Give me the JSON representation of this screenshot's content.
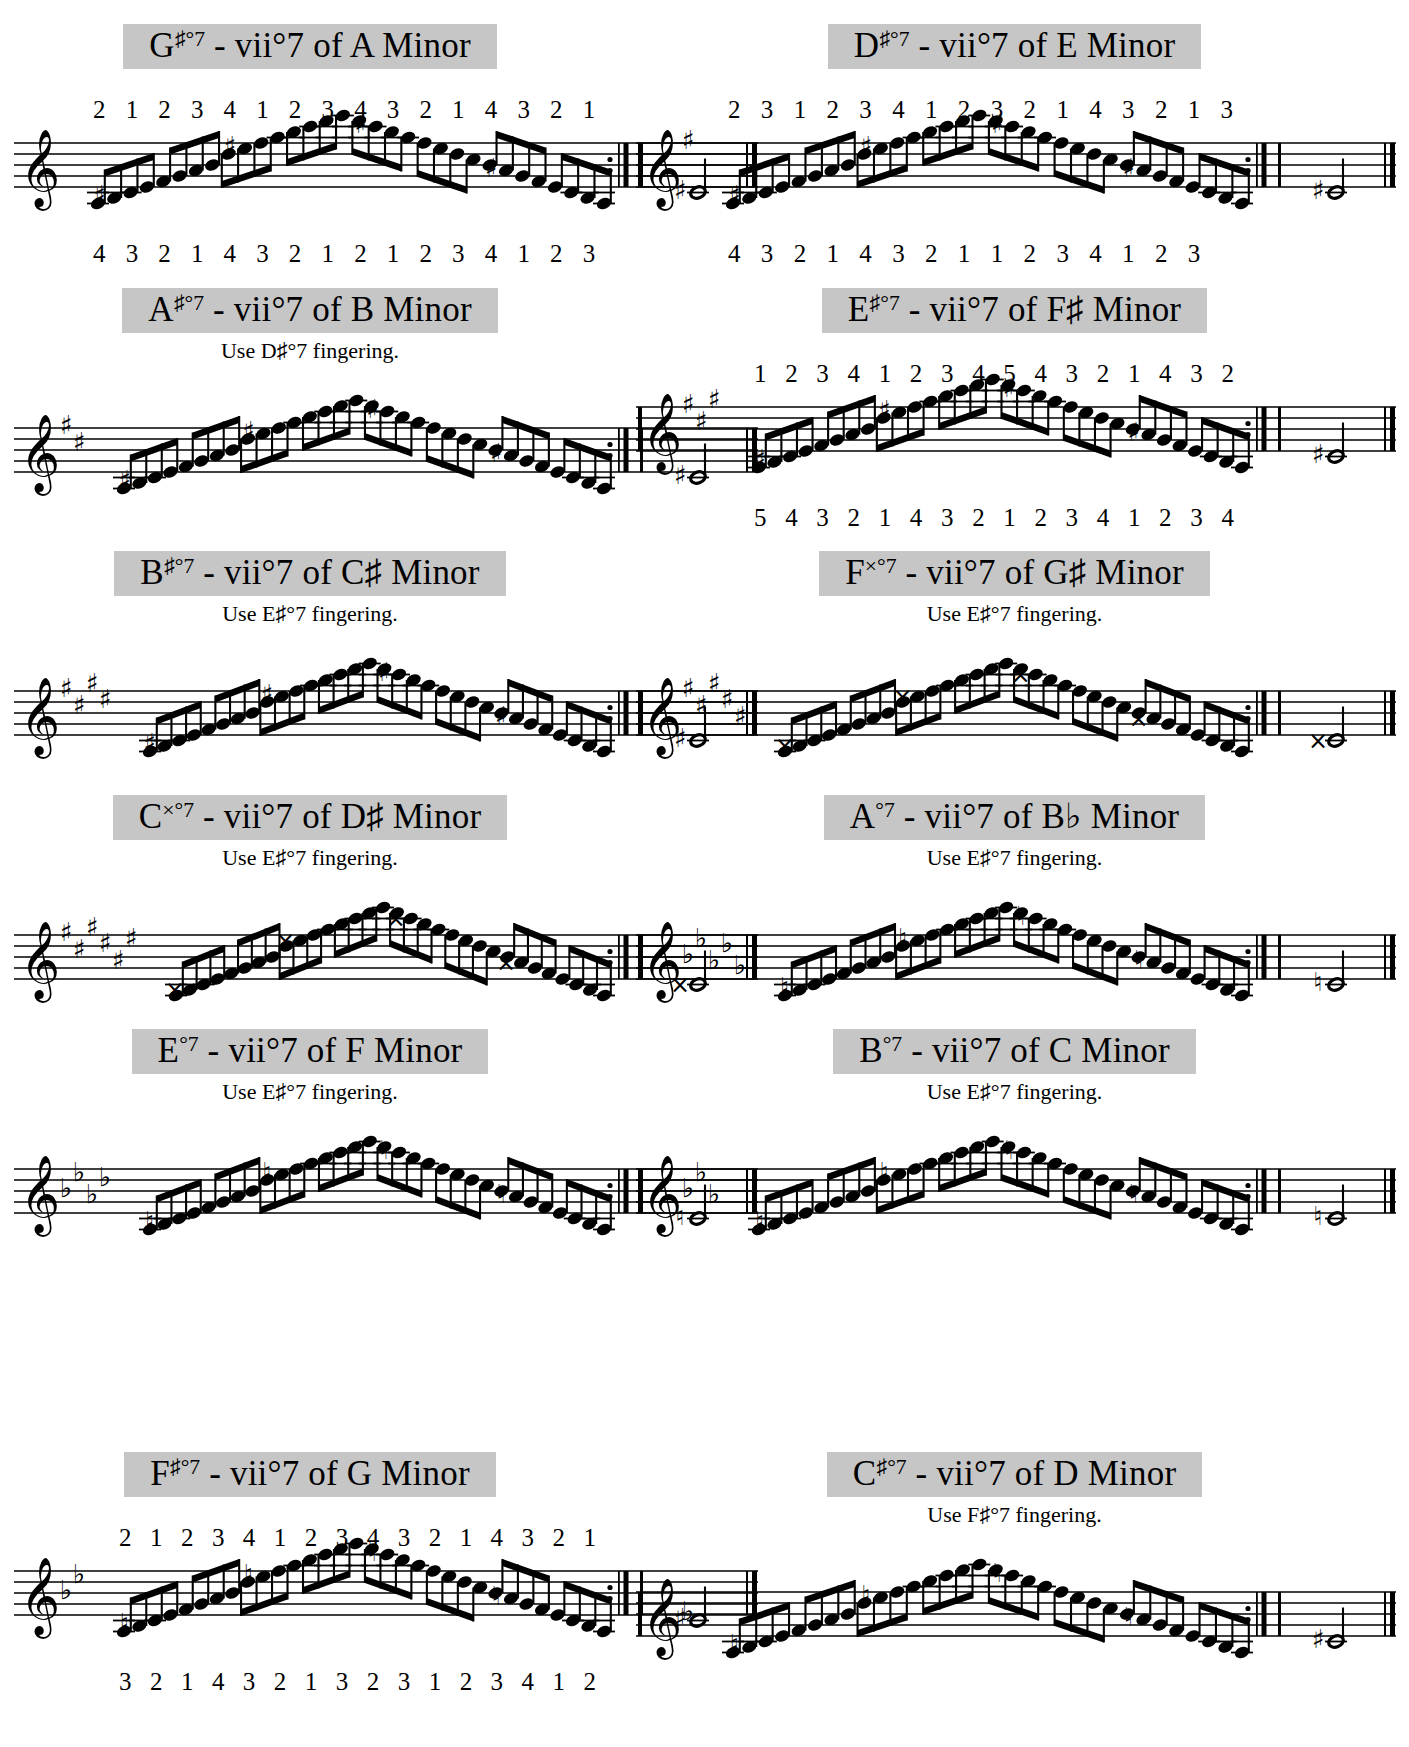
{
  "page": {
    "kind": "sheet-music",
    "instrument_clef": "treble",
    "note_value": "eighth",
    "final_note_value": "half",
    "columns": 2,
    "rows": 6,
    "banner_color": "#c6c6c6",
    "ink_color": "#000000",
    "paper_color": "#ffffff"
  },
  "glyphs": {
    "sharp": "♯",
    "flat": "♭",
    "natural": "♮",
    "double_sharp": "×",
    "degree": "°",
    "treble_clef": "𝄞"
  },
  "exercises": [
    {
      "id": "gs-dim7",
      "root": "G",
      "root_accidental": "sharp",
      "title_root": "G",
      "title_sup": "♯°7",
      "title_rest": " - vii°7 of A Minor",
      "key_of": "A Minor",
      "subtitle": "",
      "key_signature": [],
      "fingering_above": [
        "2",
        "1",
        "2",
        "3",
        "4",
        "1",
        "2",
        "3",
        "4",
        "3",
        "2",
        "1",
        "4",
        "3",
        "2",
        "1"
      ],
      "fingering_below": [
        "4",
        "3",
        "2",
        "1",
        "4",
        "3",
        "2",
        "1",
        "2",
        "1",
        "2",
        "3",
        "4",
        "1",
        "2",
        "3"
      ],
      "repeat_start": false,
      "repeat_end": true,
      "final_note_accidental": "sharp"
    },
    {
      "id": "ds-dim7",
      "root": "D",
      "root_accidental": "sharp",
      "title_root": "D",
      "title_sup": "♯°7",
      "title_rest": " - vii°7 of E Minor",
      "key_of": "E Minor",
      "subtitle": "",
      "key_signature": [
        "sharp"
      ],
      "fingering_above": [
        "2",
        "3",
        "1",
        "2",
        "3",
        "4",
        "1",
        "2",
        "3",
        "2",
        "1",
        "4",
        "3",
        "2",
        "1",
        "3"
      ],
      "fingering_below": [
        "4",
        "3",
        "2",
        "1",
        "4",
        "3",
        "2",
        "1",
        "1",
        "2",
        "3",
        "4",
        "1",
        "2",
        "3",
        ""
      ],
      "repeat_start": true,
      "repeat_end": true,
      "final_note_accidental": "sharp"
    },
    {
      "id": "as-dim7",
      "root": "A",
      "root_accidental": "sharp",
      "title_root": "A",
      "title_sup": "♯°7",
      "title_rest": " - vii°7 of B Minor",
      "key_of": "B Minor",
      "subtitle": "Use D♯°7 fingering.",
      "subtitle_plain": "Use D#°7 fingering.",
      "key_signature": [
        "sharp",
        "sharp"
      ],
      "fingering_above": [],
      "fingering_below": [],
      "repeat_start": false,
      "repeat_end": true,
      "final_note_accidental": "sharp"
    },
    {
      "id": "es-dim7",
      "root": "E",
      "root_accidental": "sharp",
      "title_root": "E",
      "title_sup": "♯°7",
      "title_rest": " - vii°7 of F♯ Minor",
      "key_of": "F# Minor",
      "subtitle": "",
      "key_signature": [
        "sharp",
        "sharp",
        "sharp"
      ],
      "fingering_above": [
        "1",
        "2",
        "3",
        "4",
        "1",
        "2",
        "3",
        "4",
        "5",
        "4",
        "3",
        "2",
        "1",
        "4",
        "3",
        "2"
      ],
      "fingering_below": [
        "5",
        "4",
        "3",
        "2",
        "1",
        "4",
        "3",
        "2",
        "1",
        "2",
        "3",
        "4",
        "1",
        "2",
        "3",
        "4"
      ],
      "repeat_start": true,
      "repeat_end": true,
      "final_note_accidental": "sharp"
    },
    {
      "id": "bs-dim7",
      "root": "B",
      "root_accidental": "sharp",
      "title_root": "B",
      "title_sup": "♯°7",
      "title_rest": " - vii°7 of C♯ Minor",
      "key_of": "C# Minor",
      "subtitle": "Use E♯°7 fingering.",
      "subtitle_plain": "Use E#°7 fingering.",
      "key_signature": [
        "sharp",
        "sharp",
        "sharp",
        "sharp"
      ],
      "fingering_above": [],
      "fingering_below": [],
      "repeat_start": false,
      "repeat_end": true,
      "final_note_accidental": "sharp"
    },
    {
      "id": "fx-dim7",
      "root": "F",
      "root_accidental": "double_sharp",
      "title_root": "F",
      "title_sup": "×°7",
      "title_rest": " - vii°7 of G♯ Minor",
      "key_of": "G# Minor",
      "subtitle": "Use E♯°7 fingering.",
      "subtitle_plain": "Use E#°7 fingering.",
      "key_signature": [
        "sharp",
        "sharp",
        "sharp",
        "sharp",
        "sharp"
      ],
      "fingering_above": [],
      "fingering_below": [],
      "repeat_start": true,
      "repeat_end": true,
      "final_note_accidental": "double_sharp"
    },
    {
      "id": "cx-dim7",
      "root": "C",
      "root_accidental": "double_sharp",
      "title_root": "C",
      "title_sup": "×°7",
      "title_rest": " - vii°7 of D♯ Minor",
      "key_of": "D# Minor",
      "subtitle": "Use E♯°7 fingering.",
      "subtitle_plain": "Use E#°7 fingering.",
      "key_signature": [
        "sharp",
        "sharp",
        "sharp",
        "sharp",
        "sharp",
        "sharp"
      ],
      "fingering_above": [],
      "fingering_below": [],
      "repeat_start": false,
      "repeat_end": true,
      "final_note_accidental": "double_sharp"
    },
    {
      "id": "a-dim7",
      "root": "A",
      "root_accidental": "natural",
      "title_root": "A",
      "title_sup": "°7",
      "title_rest": " - vii°7 of B♭ Minor",
      "key_of": "Bb Minor",
      "subtitle": "Use E♯°7 fingering.",
      "subtitle_plain": "Use E#°7 fingering.",
      "key_signature": [
        "flat",
        "flat",
        "flat",
        "flat",
        "flat"
      ],
      "fingering_above": [],
      "fingering_below": [],
      "repeat_start": true,
      "repeat_end": true,
      "final_note_accidental": "natural"
    },
    {
      "id": "e-dim7",
      "root": "E",
      "root_accidental": "natural",
      "title_root": "E",
      "title_sup": "°7",
      "title_rest": " - vii°7 of F Minor",
      "key_of": "F Minor",
      "subtitle": "Use E♯°7 fingering.",
      "subtitle_plain": "Use E#°7 fingering.",
      "key_signature": [
        "flat",
        "flat",
        "flat",
        "flat"
      ],
      "fingering_above": [],
      "fingering_below": [],
      "repeat_start": false,
      "repeat_end": true,
      "final_note_accidental": "natural"
    },
    {
      "id": "b-dim7",
      "root": "B",
      "root_accidental": "natural",
      "title_root": "B",
      "title_sup": "°7",
      "title_rest": " - vii°7 of C Minor",
      "key_of": "C Minor",
      "subtitle": "Use E♯°7 fingering.",
      "subtitle_plain": "Use E#°7 fingering.",
      "key_signature": [
        "flat",
        "flat",
        "flat"
      ],
      "fingering_above": [],
      "fingering_below": [],
      "repeat_start": true,
      "repeat_end": true,
      "final_note_accidental": "natural"
    },
    {
      "id": "fs-dim7",
      "root": "F",
      "root_accidental": "sharp",
      "title_root": "F",
      "title_sup": "♯°7",
      "title_rest": " - vii°7 of G Minor",
      "key_of": "G Minor",
      "subtitle": "",
      "key_signature": [
        "flat",
        "flat"
      ],
      "fingering_above": [
        "2",
        "1",
        "2",
        "3",
        "4",
        "1",
        "2",
        "3",
        "4",
        "3",
        "2",
        "1",
        "4",
        "3",
        "2",
        "1"
      ],
      "fingering_below": [
        "3",
        "2",
        "1",
        "4",
        "3",
        "2",
        "1",
        "3",
        "2",
        "3",
        "1",
        "2",
        "3",
        "4",
        "1",
        "2"
      ],
      "repeat_start": false,
      "repeat_end": true,
      "final_note_accidental": "sharp"
    },
    {
      "id": "cs-dim7",
      "root": "C",
      "root_accidental": "sharp",
      "title_root": "C",
      "title_sup": "♯°7",
      "title_rest": " - vii°7 of D Minor",
      "key_of": "D Minor",
      "subtitle": "Use F♯°7 fingering.",
      "subtitle_plain": "Use F#°7 fingering.",
      "key_signature": [
        "flat"
      ],
      "fingering_above": [],
      "fingering_below": [],
      "repeat_start": true,
      "repeat_end": true,
      "final_note_accidental": "sharp"
    }
  ]
}
